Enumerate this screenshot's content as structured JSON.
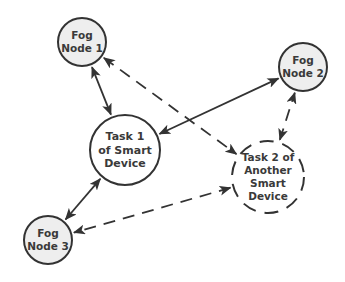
{
  "colors": {
    "fog_fill": "#eeeeee",
    "task_fill": "#ffffff",
    "stroke": "#333333",
    "text": "#3a3a3a"
  },
  "nodes": [
    {
      "id": "fog1",
      "kind": "fog",
      "lines": [
        "Fog",
        "Node 1"
      ],
      "border": "solid"
    },
    {
      "id": "fog2",
      "kind": "fog",
      "lines": [
        "Fog",
        "Node 2"
      ],
      "border": "solid"
    },
    {
      "id": "task1",
      "kind": "task",
      "lines": [
        "Task 1",
        "of Smart",
        "Device"
      ],
      "border": "solid"
    },
    {
      "id": "task2",
      "kind": "task",
      "lines": [
        "Task 2 of",
        "Another",
        "Smart",
        "Device"
      ],
      "border": "dashed"
    },
    {
      "id": "fog3",
      "kind": "fog",
      "lines": [
        "Fog",
        "Node 3"
      ],
      "border": "solid"
    }
  ],
  "edges": [
    {
      "from": "fog1",
      "to": "task1",
      "style": "solid",
      "direction": "both"
    },
    {
      "from": "task1",
      "to": "fog2",
      "style": "solid",
      "direction": "both"
    },
    {
      "from": "task1",
      "to": "fog3",
      "style": "solid",
      "direction": "both"
    },
    {
      "from": "fog1",
      "to": "task2",
      "style": "dashed",
      "direction": "both"
    },
    {
      "from": "task2",
      "to": "fog2",
      "style": "dashed",
      "direction": "both"
    },
    {
      "from": "task2",
      "to": "fog3",
      "style": "dashed",
      "direction": "both"
    }
  ]
}
